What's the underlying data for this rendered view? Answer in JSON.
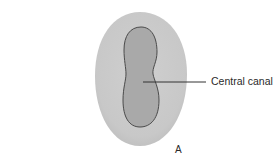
{
  "figure": {
    "callouts": [
      {
        "label": "Central canal"
      }
    ],
    "panel_letter": "A",
    "colors": {
      "outer_fill": "#cbcbcb",
      "inner_fill": "#a9a9a9",
      "inner_stroke": "#4a4a4a",
      "leader_line": "#333333",
      "text": "#2a2a2a"
    }
  }
}
